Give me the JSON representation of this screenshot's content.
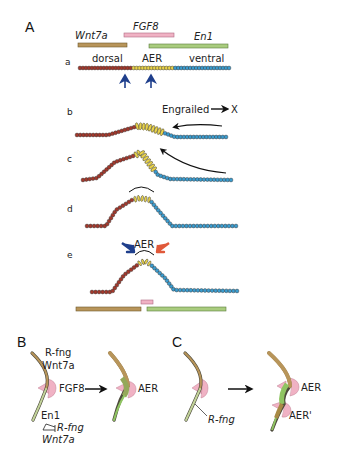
{
  "figure": {
    "panels": [
      {
        "id": "A",
        "label": "A"
      },
      {
        "id": "B",
        "label": "B"
      },
      {
        "id": "C",
        "label": "C"
      }
    ]
  },
  "panelA": {
    "genes": {
      "wnt7a": {
        "label": "Wnt7a",
        "color": "#b8955a"
      },
      "fgf8": {
        "label": "FGF8",
        "color": "#f0b2c4"
      },
      "en1": {
        "label": "En1",
        "color": "#a9cc7e"
      }
    },
    "rows": [
      {
        "label": "a",
        "annotations": [
          "dorsal",
          "AER",
          "ventral"
        ]
      },
      {
        "label": "b",
        "annotations": [
          "Engrailed",
          "X"
        ]
      },
      {
        "label": "c"
      },
      {
        "label": "d"
      },
      {
        "label": "e",
        "annotations": [
          "AER"
        ]
      }
    ],
    "engrailed_label": "Engrailed",
    "x_label": "X",
    "aer_label": "AER",
    "dorsal_label": "dorsal",
    "ventral_label": "ventral",
    "cell_colors": {
      "dorsal": "#a4382b",
      "aer": "#e8d24a",
      "ventral": "#3a9ccf"
    },
    "arrow_colors": {
      "blue": "#1f3f8c",
      "red": "#e0593a"
    }
  },
  "panelB": {
    "top_label_1": "R-fng",
    "top_label_2": "Wnt7a",
    "fgf8_label": "FGF8",
    "aer_label": "AER",
    "bottom_en1": "En1",
    "bottom_rfng": "R-fng",
    "bottom_wnt7a": "Wnt7a"
  },
  "panelC": {
    "rfng_label": "R-fng",
    "aer_label": "AER",
    "aer_prime_label": "AER'"
  }
}
